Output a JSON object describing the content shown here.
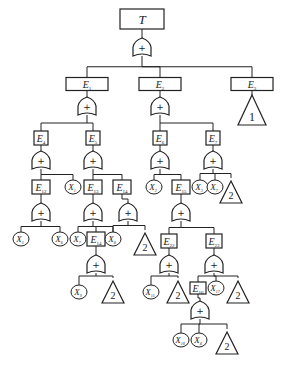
{
  "diagram": {
    "type": "fault-tree",
    "stroke_color": "#222222",
    "nodes": [
      {
        "id": "T",
        "kind": "event",
        "label": "T",
        "sub": "",
        "x": 142,
        "y": 19,
        "w": 44,
        "h": 20
      },
      {
        "id": "g0",
        "kind": "or",
        "label": "+",
        "x": 142,
        "y": 48
      },
      {
        "id": "E1",
        "kind": "event",
        "label": "E",
        "sub": "1",
        "x": 87,
        "y": 84,
        "w": 42,
        "h": 13
      },
      {
        "id": "E2",
        "kind": "event",
        "label": "E",
        "sub": "2",
        "x": 160,
        "y": 84,
        "w": 42,
        "h": 13
      },
      {
        "id": "E3",
        "kind": "event",
        "label": "E",
        "sub": "3",
        "x": 252,
        "y": 84,
        "w": 42,
        "h": 13
      },
      {
        "id": "t1",
        "kind": "transfer",
        "label": "1",
        "x": 252,
        "y": 110
      },
      {
        "id": "g1",
        "kind": "or",
        "label": "+",
        "x": 87,
        "y": 107
      },
      {
        "id": "g2",
        "kind": "or",
        "label": "+",
        "x": 160,
        "y": 107
      },
      {
        "id": "E4",
        "kind": "event",
        "label": "E",
        "sub": "4",
        "x": 41,
        "y": 138,
        "w": 14,
        "h": 14
      },
      {
        "id": "E5",
        "kind": "event",
        "label": "E",
        "sub": "5",
        "x": 93,
        "y": 138,
        "w": 14,
        "h": 14
      },
      {
        "id": "E6",
        "kind": "event",
        "label": "E",
        "sub": "6",
        "x": 160,
        "y": 138,
        "w": 14,
        "h": 14
      },
      {
        "id": "E7",
        "kind": "event",
        "label": "E",
        "sub": "7",
        "x": 213,
        "y": 138,
        "w": 14,
        "h": 14
      },
      {
        "id": "g4",
        "kind": "or",
        "label": "+",
        "x": 41,
        "y": 161
      },
      {
        "id": "g5",
        "kind": "or",
        "label": "+",
        "x": 93,
        "y": 161
      },
      {
        "id": "g6",
        "kind": "or",
        "label": "+",
        "x": 160,
        "y": 161
      },
      {
        "id": "g7",
        "kind": "or",
        "label": "+",
        "x": 213,
        "y": 161
      },
      {
        "id": "E12",
        "kind": "event",
        "label": "E",
        "sub": "12",
        "x": 41,
        "y": 187,
        "w": 18,
        "h": 14
      },
      {
        "id": "X1",
        "kind": "basic",
        "label": "X",
        "sub": "1",
        "x": 73,
        "y": 187
      },
      {
        "id": "E13",
        "kind": "event",
        "label": "E",
        "sub": "13",
        "x": 93,
        "y": 187,
        "w": 18,
        "h": 14
      },
      {
        "id": "E14a",
        "kind": "event",
        "label": "E",
        "sub": "14",
        "x": 122,
        "y": 187,
        "w": 18,
        "h": 14
      },
      {
        "id": "X2",
        "kind": "basic",
        "label": "X",
        "sub": "2",
        "x": 154,
        "y": 187
      },
      {
        "id": "E15",
        "kind": "event",
        "label": "E",
        "sub": "15",
        "x": 181,
        "y": 187,
        "w": 18,
        "h": 14
      },
      {
        "id": "X3",
        "kind": "basic",
        "label": "X",
        "sub": "3",
        "x": 200,
        "y": 187
      },
      {
        "id": "X7b",
        "kind": "basic",
        "label": "X",
        "sub": "7",
        "x": 215,
        "y": 187
      },
      {
        "id": "t2a",
        "kind": "transfer",
        "label": "2",
        "x": 231,
        "y": 192
      },
      {
        "id": "g12",
        "kind": "or",
        "label": "+",
        "x": 41,
        "y": 213
      },
      {
        "id": "g13",
        "kind": "or",
        "label": "+",
        "x": 93,
        "y": 213
      },
      {
        "id": "g14",
        "kind": "or",
        "label": "+",
        "x": 128,
        "y": 213
      },
      {
        "id": "g15",
        "kind": "or",
        "label": "+",
        "x": 181,
        "y": 213
      },
      {
        "id": "X5",
        "kind": "basic",
        "label": "X",
        "sub": "5",
        "x": 21,
        "y": 239
      },
      {
        "id": "X6",
        "kind": "basic",
        "label": "X",
        "sub": "6",
        "x": 60,
        "y": 239
      },
      {
        "id": "X7",
        "kind": "basic",
        "label": "X",
        "sub": "7",
        "x": 78,
        "y": 239
      },
      {
        "id": "E14",
        "kind": "event",
        "label": "E",
        "sub": "14",
        "x": 96,
        "y": 239,
        "w": 18,
        "h": 14
      },
      {
        "id": "X8",
        "kind": "basic",
        "label": "X",
        "sub": "8",
        "x": 113,
        "y": 239
      },
      {
        "id": "t2b",
        "kind": "transfer",
        "label": "2",
        "x": 145,
        "y": 244
      },
      {
        "id": "E22",
        "kind": "event",
        "label": "E",
        "sub": "22",
        "x": 169,
        "y": 241,
        "w": 16,
        "h": 14
      },
      {
        "id": "E23",
        "kind": "event",
        "label": "E",
        "sub": "23",
        "x": 214,
        "y": 241,
        "w": 16,
        "h": 14
      },
      {
        "id": "g14b",
        "kind": "or",
        "label": "+",
        "x": 96,
        "y": 265
      },
      {
        "id": "g22",
        "kind": "or",
        "label": "+",
        "x": 169,
        "y": 265
      },
      {
        "id": "g23",
        "kind": "or",
        "label": "+",
        "x": 214,
        "y": 265
      },
      {
        "id": "X9",
        "kind": "basic",
        "label": "X",
        "sub": "9",
        "x": 79,
        "y": 292
      },
      {
        "id": "t2c",
        "kind": "transfer",
        "label": "2",
        "x": 113,
        "y": 292
      },
      {
        "id": "X15",
        "kind": "basic",
        "label": "X",
        "sub": "15",
        "x": 151,
        "y": 292
      },
      {
        "id": "t2d",
        "kind": "transfer",
        "label": "2",
        "x": 178,
        "y": 292
      },
      {
        "id": "E16",
        "kind": "event",
        "label": "E",
        "sub": "16",
        "x": 198,
        "y": 288,
        "w": 16,
        "h": 12
      },
      {
        "id": "X17",
        "kind": "basic",
        "label": "X",
        "sub": "17",
        "x": 216,
        "y": 288
      },
      {
        "id": "t2e",
        "kind": "transfer",
        "label": "2",
        "x": 238,
        "y": 292
      },
      {
        "id": "g16",
        "kind": "or",
        "label": "+",
        "x": 200,
        "y": 311
      },
      {
        "id": "X10",
        "kind": "basic",
        "label": "X",
        "sub": "10",
        "x": 181,
        "y": 340
      },
      {
        "id": "X4",
        "kind": "basic",
        "label": "X",
        "sub": "4",
        "x": 199,
        "y": 340
      },
      {
        "id": "t2f",
        "kind": "transfer",
        "label": "2",
        "x": 227,
        "y": 343
      }
    ]
  }
}
